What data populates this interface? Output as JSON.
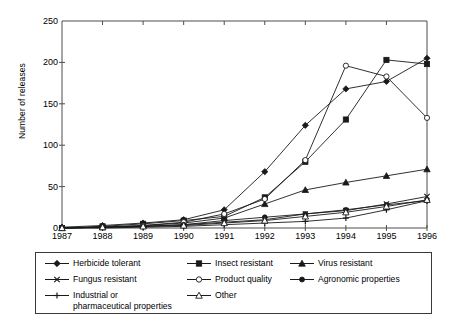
{
  "chart": {
    "type": "line",
    "title": "",
    "xlabel": "",
    "ylabel": "Number of releases",
    "x": [
      1987,
      1988,
      1989,
      1990,
      1991,
      1992,
      1993,
      1994,
      1995,
      1996
    ],
    "xtick_labels": [
      "1987",
      "1988",
      "1989",
      "1990",
      "1991",
      "1992",
      "1993",
      "1994",
      "1995",
      "1996"
    ],
    "ytick_labels": [
      "0",
      "50",
      "100",
      "150",
      "200",
      "250"
    ],
    "yticks": [
      0,
      50,
      100,
      150,
      200,
      250
    ],
    "ylim": [
      0,
      250
    ],
    "grid": false,
    "legend_position": "below-axes"
  },
  "chart_data": {
    "type": "line",
    "title": "",
    "xlabel": "",
    "ylabel": "Number of releases",
    "categories": [
      "1987",
      "1988",
      "1989",
      "1990",
      "1991",
      "1992",
      "1993",
      "1994",
      "1995",
      "1996"
    ],
    "x": [
      1987,
      1988,
      1989,
      1990,
      1991,
      1992,
      1993,
      1994,
      1995,
      1996
    ],
    "ylim": [
      0,
      250
    ],
    "yticks": [
      0,
      50,
      100,
      150,
      200,
      250
    ],
    "grid": false,
    "legend_position": "below-axes",
    "series": [
      {
        "name": "Herbicide tolerant",
        "marker": "filled-diamond",
        "values": [
          1,
          3,
          6,
          10,
          22,
          68,
          124,
          168,
          177,
          205
        ]
      },
      {
        "name": "Insect resistant",
        "marker": "filled-square",
        "values": [
          0,
          2,
          5,
          9,
          14,
          37,
          80,
          131,
          203,
          198
        ]
      },
      {
        "name": "Virus resistant",
        "marker": "filled-triangle",
        "values": [
          0,
          1,
          3,
          6,
          12,
          29,
          46,
          55,
          63,
          71
        ]
      },
      {
        "name": "Fungus resistant",
        "marker": "cross-x",
        "values": [
          0,
          1,
          2,
          4,
          7,
          10,
          17,
          21,
          29,
          38
        ]
      },
      {
        "name": "Product quality",
        "marker": "open-circle",
        "values": [
          0,
          1,
          3,
          7,
          17,
          35,
          82,
          196,
          183,
          133
        ]
      },
      {
        "name": "Agronomic properties",
        "marker": "filled-circle",
        "values": [
          0,
          1,
          2,
          4,
          9,
          13,
          17,
          22,
          28,
          33
        ]
      },
      {
        "name": "Industrial or pharmaceutical properties",
        "marker": "plus",
        "values": [
          0,
          0,
          1,
          2,
          4,
          6,
          8,
          12,
          22,
          33
        ]
      },
      {
        "name": "Other",
        "marker": "open-triangle",
        "values": [
          0,
          1,
          2,
          3,
          6,
          9,
          14,
          19,
          26,
          34
        ]
      }
    ]
  },
  "legend": {
    "items": [
      {
        "label": "Herbicide tolerant",
        "marker": "filled-diamond",
        "col": 0,
        "row": 0
      },
      {
        "label": "Fungus resistant",
        "marker": "cross-x",
        "col": 0,
        "row": 1
      },
      {
        "label": "Industrial or\npharmaceutical properties",
        "marker": "plus",
        "col": 0,
        "row": 2
      },
      {
        "label": "Insect resistant",
        "marker": "filled-square",
        "col": 1,
        "row": 0
      },
      {
        "label": "Product quality",
        "marker": "open-circle",
        "col": 1,
        "row": 1
      },
      {
        "label": "Other",
        "marker": "open-triangle",
        "col": 1,
        "row": 2
      },
      {
        "label": "Virus resistant",
        "marker": "filled-triangle",
        "col": 2,
        "row": 0
      },
      {
        "label": "Agronomic properties",
        "marker": "filled-circle",
        "col": 2,
        "row": 1
      }
    ]
  },
  "colors": {
    "axis": "#4d4d4d",
    "line": "#1a1a1a",
    "legend_border": "#3a3a3a",
    "background": "#ffffff"
  }
}
